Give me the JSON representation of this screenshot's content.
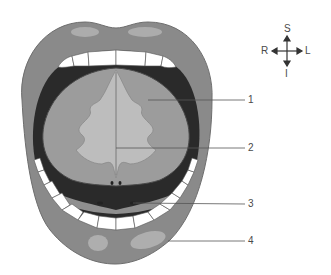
{
  "figure": {
    "colors": {
      "lips": "#8a8a8a",
      "lip_highlight": "#b4b4b4",
      "oral_cavity": "#2a2a2a",
      "tongue": "#9c9c9c",
      "tongue_underside": "#bdbdbd",
      "teeth": "#ffffff",
      "leader_line": "#555555",
      "text": "#4a4a4a"
    }
  },
  "compass": {
    "superior": "S",
    "inferior": "I",
    "right": "R",
    "left": "L"
  },
  "labels": [
    {
      "number": "1",
      "y": 100
    },
    {
      "number": "2",
      "y": 148
    },
    {
      "number": "3",
      "y": 204
    },
    {
      "number": "4",
      "y": 241
    }
  ]
}
